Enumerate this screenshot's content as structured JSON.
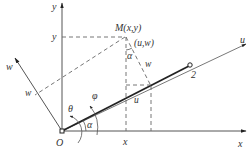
{
  "figure": {
    "axes": {
      "x_label": "x",
      "y_label": "y",
      "u_label": "u",
      "w_label": "w"
    },
    "origin_label": "O",
    "point_M_label": "M(x,y)",
    "local_coords_label": "(u,w)",
    "point_2_label": "2",
    "projection_labels": {
      "y_on_y_axis": "y",
      "x_on_x_axis": "x",
      "w_on_w_axis": "w",
      "w_segment": "w",
      "u_segment": "u"
    },
    "angles": {
      "theta": "θ",
      "phi": "φ",
      "alpha_at_origin": "α",
      "alpha_at_M": "α"
    }
  }
}
